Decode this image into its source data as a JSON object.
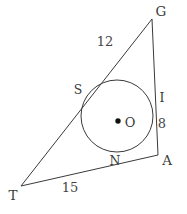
{
  "figure": {
    "type": "geometry-diagram",
    "background_color": "#ffffff",
    "stroke_color": "#3a3a3a",
    "width": 187,
    "height": 214
  },
  "triangle": {
    "name": "TGA",
    "vertices": [
      {
        "label": "G",
        "x": 152,
        "y": 19,
        "label_x": 161,
        "label_y": 12
      },
      {
        "label": "A",
        "x": 158,
        "y": 155,
        "label_x": 167,
        "label_y": 161
      },
      {
        "label": "T",
        "x": 21,
        "y": 186,
        "label_x": 13,
        "label_y": 196
      }
    ]
  },
  "circle": {
    "center_label": "O",
    "center_x": 117,
    "center_y": 116,
    "radius": 36,
    "center_label_x": 130,
    "center_label_y": 122,
    "center_dot_x": 118,
    "center_dot_y": 121
  },
  "tangent_points": [
    {
      "label": "S",
      "x": 87,
      "y": 96,
      "label_x": 78,
      "label_y": 90
    },
    {
      "label": "I",
      "x": 153,
      "y": 114,
      "label_x": 162,
      "label_y": 98
    },
    {
      "label": "N",
      "x": 119,
      "y": 152,
      "label_x": 115,
      "label_y": 161
    }
  ],
  "measurements": [
    {
      "value": "12",
      "side": "TG",
      "label_x": 105,
      "label_y": 41
    },
    {
      "value": "8",
      "side": "IA",
      "label_x": 162,
      "label_y": 123
    },
    {
      "value": "15",
      "side": "TN",
      "label_x": 70,
      "label_y": 187
    }
  ]
}
